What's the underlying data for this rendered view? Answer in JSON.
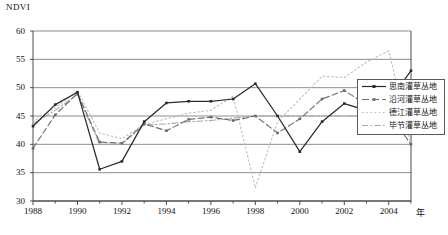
{
  "chart_data": {
    "type": "line",
    "title": "",
    "ylabel": "NDVI",
    "xlabel": "年",
    "ylim": [
      30,
      60
    ],
    "yticks": [
      30,
      35,
      40,
      45,
      50,
      55,
      60
    ],
    "xlim": [
      1988,
      2005
    ],
    "xticks": [
      1988,
      1990,
      1992,
      1994,
      1996,
      1998,
      2000,
      2002,
      2004
    ],
    "x": [
      1988,
      1989,
      1990,
      1991,
      1992,
      1993,
      1994,
      1995,
      1996,
      1997,
      1998,
      1999,
      2000,
      2001,
      2002,
      2003,
      2004,
      2005
    ],
    "grid": true,
    "legend_position": "right",
    "series": [
      {
        "name": "思南灌草丛地",
        "style": "solid",
        "color": "#2b2b2b",
        "values": [
          43.2,
          47.0,
          49.2,
          35.6,
          37.0,
          44.0,
          47.3,
          47.6,
          47.6,
          48.0,
          50.7,
          45.0,
          38.7,
          44.0,
          47.2,
          46.0,
          47.5,
          53.0
        ]
      },
      {
        "name": "沿河灌草丛地",
        "style": "dashed",
        "color": "#6b6b6b",
        "values": [
          39.3,
          45.2,
          49.0,
          40.4,
          40.2,
          43.6,
          42.4,
          44.4,
          44.8,
          44.2,
          45.0,
          42.0,
          44.5,
          48.0,
          49.5,
          47.0,
          45.5,
          40.0
        ]
      },
      {
        "name": "德江灌草丛地",
        "style": "dotted",
        "color": "#bdbdbd",
        "values": [
          44.0,
          46.5,
          49.4,
          42.0,
          41.0,
          43.5,
          44.5,
          45.5,
          46.0,
          48.5,
          32.3,
          44.0,
          48.0,
          52.0,
          51.8,
          54.5,
          56.5,
          40.0
        ]
      },
      {
        "name": "毕节灌草丛地",
        "style": "dashdot",
        "color": "#a6a6a6",
        "values": [
          43.6,
          46.0,
          48.8,
          40.0,
          40.0,
          43.4,
          43.6,
          44.0,
          44.2,
          44.6,
          45.0,
          45.0,
          45.0,
          45.0,
          45.0,
          45.0,
          45.0,
          45.0
        ]
      }
    ]
  },
  "legend": {
    "items": [
      {
        "label": "思南灌草丛地"
      },
      {
        "label": "沿河灌草丛地"
      },
      {
        "label": "德江灌草丛地"
      },
      {
        "label": "毕节灌草丛地"
      }
    ]
  },
  "axes": {
    "ylabel": "NDVI",
    "xlabel": "年",
    "ytick_labels": [
      "60",
      "55",
      "50",
      "45",
      "40",
      "35",
      "30"
    ],
    "xtick_labels": [
      "1988",
      "1990",
      "1992",
      "1994",
      "1996",
      "1998",
      "2000",
      "2002",
      "2004"
    ]
  },
  "colors": {
    "axis": "#4d4d4d",
    "grid": "#808080",
    "series_1": "#2b2b2b",
    "series_2": "#6b6b6b",
    "series_3": "#bdbdbd",
    "series_4": "#a6a6a6"
  }
}
